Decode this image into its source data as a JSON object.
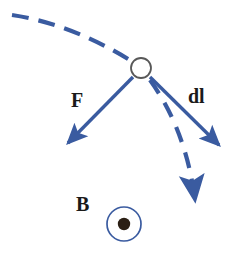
{
  "figure": {
    "type": "physics-vector-diagram",
    "background_color": "#ffffff",
    "vector_color": "#3a5ba0",
    "label_color": "#1a1a1a",
    "dot_color": "#2b1f14"
  },
  "labels": {
    "force": "F",
    "current_element": "dl",
    "magnetic_field": "B"
  },
  "elements": {
    "particle": {
      "name": "charge-circle",
      "cx": 141,
      "cy": 68,
      "r": 10,
      "stroke": "#4a4a4a",
      "fill": "#ffffff"
    },
    "field_symbol": {
      "name": "field-out-of-page",
      "cx": 124,
      "cy": 224,
      "outer_r": 17,
      "inner_r": 6,
      "stroke": "#3a5ba0",
      "dot_fill": "#2b1f14"
    },
    "force_arrow": {
      "name": "force-vector",
      "from_x": 133,
      "from_y": 77,
      "to_x": 62,
      "to_y": 149
    },
    "dl_arrow": {
      "name": "dl-vector",
      "from_x": 150,
      "from_y": 77,
      "to_x": 226,
      "to_y": 151
    },
    "incoming_path": {
      "name": "incoming-trajectory",
      "start_x": 12,
      "start_y": 15,
      "end_x": 133,
      "end_y": 62,
      "dashed": true
    },
    "outgoing_path": {
      "name": "outgoing-trajectory",
      "start_x": 148,
      "start_y": 78,
      "end_x": 196,
      "end_y": 216,
      "dashed": true
    }
  }
}
